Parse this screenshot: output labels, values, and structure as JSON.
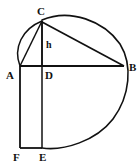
{
  "figure": {
    "kind": "geometry-diagram",
    "canvas": {
      "width": 139,
      "height": 166,
      "background": "#ffffff"
    },
    "stroke_color": "#111111",
    "label_color": "#111111",
    "points": [
      {
        "name": "C",
        "label": "C",
        "x": 42,
        "y": 21,
        "label_x": 37,
        "label_y": 6,
        "role": "apex"
      },
      {
        "name": "A",
        "label": "A",
        "x": 20,
        "y": 66,
        "label_x": 6,
        "label_y": 70,
        "role": "left-base"
      },
      {
        "name": "B",
        "label": "B",
        "x": 124,
        "y": 66,
        "label_x": 129,
        "label_y": 62,
        "role": "right-base"
      },
      {
        "name": "D",
        "label": "D",
        "x": 42,
        "y": 66,
        "label_x": 45,
        "label_y": 70,
        "role": "foot-of-altitude"
      },
      {
        "name": "F",
        "label": "F",
        "x": 20,
        "y": 148,
        "label_x": 13,
        "label_y": 152,
        "role": "bottom-left"
      },
      {
        "name": "E",
        "label": "E",
        "x": 42,
        "y": 148,
        "label_x": 39,
        "label_y": 152,
        "role": "bottom-right"
      }
    ],
    "measures": [
      {
        "name": "altitude",
        "label": "h",
        "label_x": 46,
        "label_y": 40,
        "from": "C",
        "to": "D"
      }
    ],
    "segments": [
      {
        "name": "segment-AB",
        "from": "A",
        "to": "B",
        "x1": 20,
        "y1": 66,
        "x2": 124,
        "y2": 66,
        "width": 2.1
      },
      {
        "name": "segment-CD",
        "from": "C",
        "to": "D",
        "x1": 42,
        "y1": 21,
        "x2": 42,
        "y2": 66,
        "width": 1.9
      },
      {
        "name": "segment-AC",
        "from": "A",
        "to": "C",
        "x1": 20,
        "y1": 66,
        "x2": 42,
        "y2": 21,
        "width": 1.5
      },
      {
        "name": "segment-CB",
        "from": "C",
        "to": "B",
        "x1": 42,
        "y1": 22,
        "x2": 124,
        "y2": 66,
        "width": 1.7
      },
      {
        "name": "segment-AF",
        "from": "A",
        "to": "F",
        "x1": 20,
        "y1": 66,
        "x2": 20,
        "y2": 148,
        "width": 1.8
      },
      {
        "name": "segment-DE",
        "from": "D",
        "to": "E",
        "x1": 42,
        "y1": 66,
        "x2": 42,
        "y2": 148,
        "width": 1.5
      },
      {
        "name": "segment-FE",
        "from": "F",
        "to": "E",
        "x1": 20,
        "y1": 148,
        "x2": 42,
        "y2": 148,
        "width": 1.8
      }
    ],
    "arcs": [
      {
        "name": "arc-A-to-C",
        "description": "small arc bulging left from A up to C",
        "path": "M 20 66 C 13 48 22 29 42 21",
        "width": 1.5
      },
      {
        "name": "arc-C-to-B-to-E",
        "description": "large circle arc from C over the top past B and down to E",
        "path": "M 42 20 C 70 8 104 21 120 44 C 133 65 130 96 113 119 C 96 141 64 151 42 148",
        "width": 1.6
      }
    ]
  }
}
